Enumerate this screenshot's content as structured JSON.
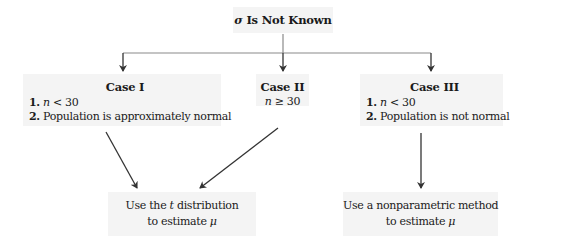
{
  "diagram": {
    "root": {
      "symbol": "σ",
      "label": " Is Not Known"
    },
    "cases": [
      {
        "title": "Case I",
        "conditions": [
          {
            "num": "1.",
            "var": "n",
            "rest": " < 30"
          },
          {
            "num": "2.",
            "text": "Population is approximately normal"
          }
        ]
      },
      {
        "title": "Case II",
        "conditions": [
          {
            "var": "n",
            "rest": " ≥ 30"
          }
        ]
      },
      {
        "title": "Case III",
        "conditions": [
          {
            "num": "1.",
            "var": "n",
            "rest": " < 30"
          },
          {
            "num": "2.",
            "text": "Population is not normal"
          }
        ]
      }
    ],
    "outcomes": [
      {
        "line1_pre": "Use the ",
        "line1_var": "t",
        "line1_post": " distribution",
        "line2_pre": "to estimate ",
        "line2_var": "μ"
      },
      {
        "line1_pre": "Use a nonparametric method",
        "line2_pre": "to estimate ",
        "line2_var": "μ"
      }
    ],
    "edges": [
      {
        "from": "root",
        "to": "Case I"
      },
      {
        "from": "root",
        "to": "Case II"
      },
      {
        "from": "root",
        "to": "Case III"
      },
      {
        "from": "Case I",
        "to": "Use the t distribution to estimate μ"
      },
      {
        "from": "Case II",
        "to": "Use the t distribution to estimate μ"
      },
      {
        "from": "Case III",
        "to": "Use a nonparametric method to estimate μ"
      }
    ],
    "colors": {
      "box_fill": "#f4f4f4",
      "line": "#444444",
      "text": "#1a1a1a"
    }
  }
}
